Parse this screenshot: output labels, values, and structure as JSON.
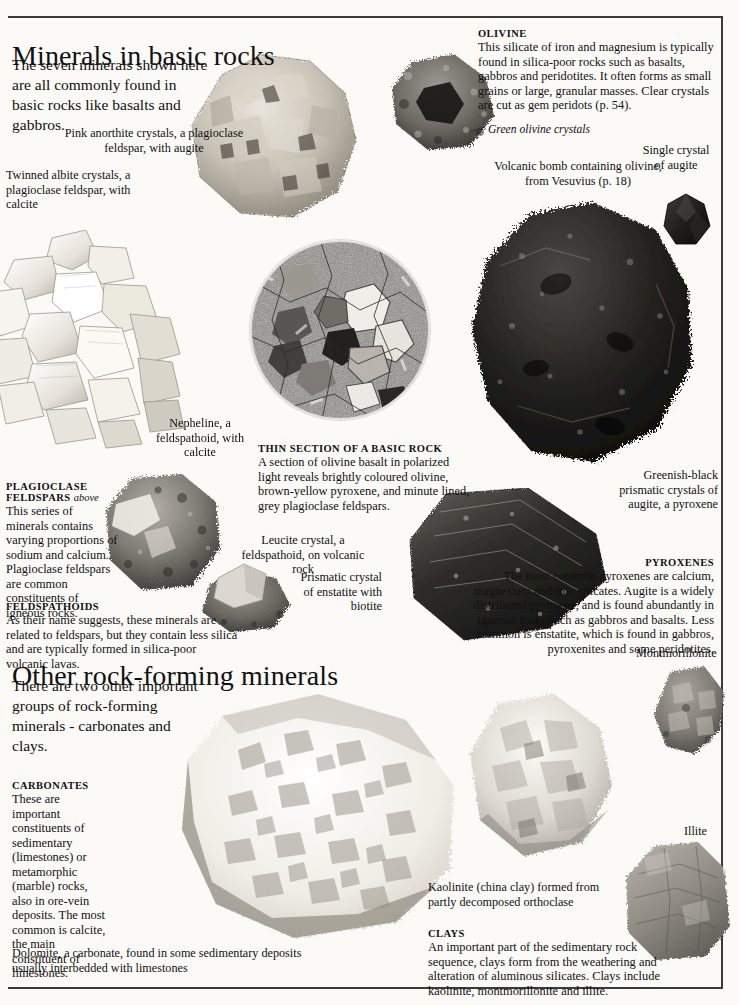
{
  "page": {
    "section1_title": "Minerals in basic rocks",
    "section1_intro": "The seven minerals shown here are all commonly found in basic rocks like basalts and gabbros.",
    "section2_title": "Other rock-forming minerals",
    "section2_intro": "There are two other important groups of rock-forming minerals - carbonates and clays."
  },
  "olivine": {
    "heading": "OLIVINE",
    "body": "This silicate of iron and magnesium is typically found in silica-poor rocks such as basalts, gabbros and peridotites. It often forms as small grains or large, granular masses. Clear crystals are cut as gem peridots (p. 54)."
  },
  "plagioclase": {
    "heading": "PLAGIOCLASE",
    "heading2": "FELDSPARS",
    "heading2_italic": "above",
    "body": "This series of minerals contains varying proportions of sodium and calcium. Plagioclase feldspars are common constituents of igneous rocks."
  },
  "feldspathoids": {
    "heading": "FELDSPATHOIDS",
    "body": "As their name suggests, these minerals are related to feldspars, but they contain less silica and are typically formed in silica-poor volcanic lavas."
  },
  "thin_section": {
    "heading": "THIN SECTION OF A  BASIC ROCK",
    "body": "A section of olivine basalt in polarized light reveals brightly coloured olivine, brown-yellow pyroxene, and minute lined, grey plagioclase feldspars."
  },
  "pyroxenes": {
    "heading": "PYROXENES",
    "body": "The most common pyroxenes are calcium, magnesium and iron silicates. Augite is a widely distributed pyroxene, and is found abundantly in igneous rocks such as gabbros and basalts. Less common is enstatite, which is found in gabbros, pyroxenites and some peridotites."
  },
  "carbonates": {
    "heading": "CARBONATES",
    "body": "These are important constituents of sedimentary (limestones) or metamorphic (marble) rocks, also in ore-vein deposits. The most common is calcite, the main constituent of limestones."
  },
  "clays": {
    "heading": "CLAYS",
    "body": "An important part of the sedimentary rock sequence, clays form from the weathering and alteration of aluminous silicates. Clays include kaolinite, montmorillonite and illite."
  },
  "captions": {
    "anorthite": "Pink anorthite crystals, a plagioclase feldspar, with augite",
    "albite": "Twinned albite crystals, a plagioclase feldspar, with calcite",
    "green_olivine": "Green olivine crystals",
    "volcanic_bomb": "Volcanic bomb containing olivine, from Vesuvius (p. 18)",
    "single_augite": "Single crystal of augite",
    "nepheline": "Nepheline, a feldspathoid, with calcite",
    "leucite": "Leucite crystal, a feldspathoid, on volcanic rock",
    "greenish_black": "Greenish-black prismatic crystals of augite, a pyroxene",
    "enstatite": "Prismatic crystal of enstatite with biotite",
    "montmorillonite": "Montmorillonite",
    "illite": "Illite",
    "kaolinite": "Kaolinite (china clay) formed from partly decomposed orthoclase",
    "dolomite": "Dolomite, a carbonate, found in some sedimentary deposits usually interbedded with limestones"
  },
  "colors": {
    "page_bg": "#fbfaf7",
    "ink": "#111111",
    "rule": "#3a3a3a",
    "rock_light": "#c9c5bc",
    "rock_dark": "#2b2b29",
    "rock_mid": "#8d8a82"
  }
}
